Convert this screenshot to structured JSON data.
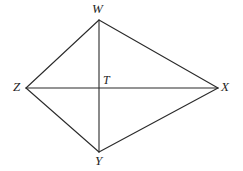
{
  "figure": {
    "kind": "geometry-diagram",
    "shape_name": "kite-wxyz",
    "background_color": "#ffffff",
    "stroke_color": "#2a2a2a",
    "stroke_width": 1.1,
    "label_color": "#1e1e1e",
    "vertices": [
      {
        "id": "W",
        "label": "W",
        "x": 99,
        "y": 20,
        "label_x": 92,
        "label_y": 2
      },
      {
        "id": "X",
        "label": "X",
        "x": 218,
        "y": 88,
        "label_x": 221,
        "label_y": 80
      },
      {
        "id": "Y",
        "label": "Y",
        "x": 99,
        "y": 152,
        "label_x": 95,
        "label_y": 154
      },
      {
        "id": "Z",
        "label": "Z",
        "x": 26,
        "y": 88,
        "label_x": 13,
        "label_y": 80
      },
      {
        "id": "T",
        "label": "T",
        "x": 99,
        "y": 88,
        "label_x": 103,
        "label_y": 74
      }
    ],
    "sides": [
      {
        "id": "WX",
        "from": "W",
        "to": "X"
      },
      {
        "id": "XY",
        "from": "X",
        "to": "Y"
      },
      {
        "id": "YZ",
        "from": "Y",
        "to": "Z"
      },
      {
        "id": "ZW",
        "from": "Z",
        "to": "W"
      }
    ],
    "diagonals": [
      {
        "id": "WY",
        "from": "W",
        "to": "Y"
      },
      {
        "id": "ZX",
        "from": "Z",
        "to": "X"
      }
    ],
    "intersection_point": "T"
  }
}
